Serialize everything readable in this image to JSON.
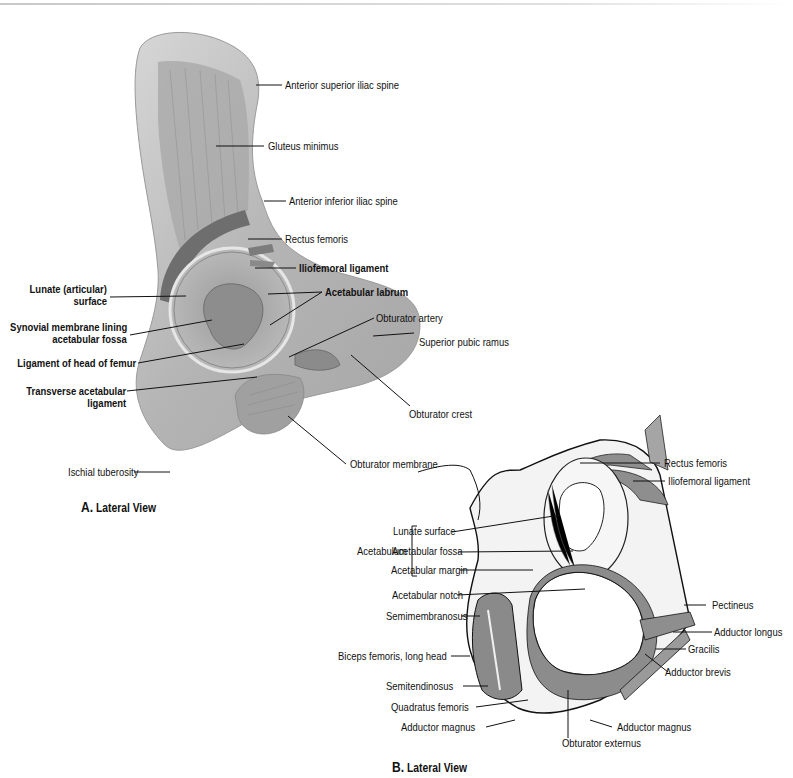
{
  "figure_a": {
    "caption_letter": "A.",
    "caption_text": "Lateral View",
    "labels": {
      "asis": "Anterior superior iliac spine",
      "gluteus_minimus": "Gluteus minimus",
      "aiis": "Anterior inferior iliac spine",
      "rectus_femoris": "Rectus femoris",
      "iliofemoral_ligament": "Iliofemoral ligament",
      "lunate_1": "Lunate (articular)",
      "lunate_2": "surface",
      "acetabular_labrum": "Acetabular labrum",
      "synovial_1": "Synovial membrane lining",
      "synovial_2": "acetabular fossa",
      "obturator_artery": "Obturator artery",
      "ligament_head_femur": "Ligament of head of femur",
      "superior_pubic_ramus": "Superior pubic ramus",
      "transverse_1": "Transverse acetabular",
      "transverse_2": "ligament",
      "obturator_crest": "Obturator crest",
      "ischial_tuberosity": "Ischial tuberosity",
      "obturator_membrane": "Obturator membrane"
    }
  },
  "figure_b": {
    "caption_letter": "B.",
    "caption_text": "Lateral View",
    "bracket_label": "Acetabulum",
    "labels": {
      "rectus_femoris": "Rectus femoris",
      "iliofemoral_ligament": "Iliofemoral ligament",
      "lunate_surface": "Lunate surface",
      "acetabular_fossa": "Acetabular fossa",
      "acetabular_margin": "Acetabular margin",
      "acetabular_notch": "Acetabular notch",
      "pectineus": "Pectineus",
      "semimembranosus": "Semimembranosus",
      "adductor_longus": "Adductor longus",
      "gracilis": "Gracilis",
      "biceps_femoris": "Biceps femoris, long head",
      "adductor_brevis": "Adductor brevis",
      "semitendinosus": "Semitendinosus",
      "quadratus_femoris": "Quadratus femoris",
      "adductor_magnus_left": "Adductor magnus",
      "adductor_magnus_right": "Adductor magnus",
      "obturator_externus": "Obturator externus"
    }
  },
  "colors": {
    "bone_gray": "#b8b8b8",
    "muscle_gray": "#8e8e8e",
    "text": "#111111"
  }
}
